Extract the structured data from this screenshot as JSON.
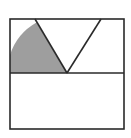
{
  "diagram": {
    "colors": {
      "stroke": "#2a2a2a",
      "shade": "#9e9e9e",
      "background": "#ffffff"
    },
    "square": {
      "x1": 10,
      "y1": 19,
      "x2": 124,
      "y2": 129
    },
    "midline_y": 73,
    "v_shape": {
      "apex": [
        67,
        73
      ],
      "left_top": [
        35,
        19
      ],
      "right_top": [
        101,
        19
      ]
    },
    "shaded_sector": {
      "center": [
        67,
        73
      ],
      "radius": 57,
      "bounded_by": [
        "left edge",
        "midline",
        "left V line"
      ]
    }
  }
}
